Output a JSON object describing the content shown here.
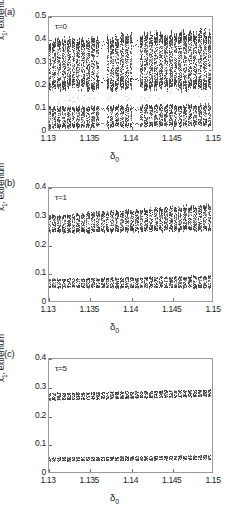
{
  "figure": {
    "type": "bifurcation-diagram",
    "axis_x_label": "δ",
    "axis_x_label_sub": "0",
    "axis_y_label": "x",
    "axis_y_label_sub": "1",
    "axis_y_label_rest": ", extremum"
  },
  "panels": [
    {
      "id": "a",
      "label": "(a)",
      "annotation": "τ=0",
      "ytick_labels": [
        "0.5",
        "0.4",
        "0.3",
        "0.2",
        "0.1",
        "0"
      ],
      "ytick_values": [
        0.5,
        0.4,
        0.3,
        0.2,
        0.1,
        0
      ],
      "xtick_labels": [
        "1.13",
        "1.135",
        "1.14",
        "1.145",
        "1.15"
      ],
      "xtick_values": [
        1.13,
        1.135,
        1.14,
        1.145,
        1.15
      ]
    },
    {
      "id": "b",
      "label": "(b)",
      "annotation": "τ=1",
      "ytick_labels": [
        "0.4",
        "0.3",
        "0.2",
        "0.1",
        "0"
      ],
      "ytick_values": [
        0.4,
        0.3,
        0.2,
        0.1,
        0
      ],
      "xtick_labels": [
        "1.13",
        "1.135",
        "1.14",
        "1.145",
        "1.15"
      ],
      "xtick_values": [
        1.13,
        1.135,
        1.14,
        1.145,
        1.15
      ]
    },
    {
      "id": "c",
      "label": "(c)",
      "annotation": "τ=5",
      "ytick_labels": [
        "0.4",
        "0.3",
        "0.2",
        "0.1",
        "0"
      ],
      "ytick_values": [
        0.4,
        0.3,
        0.2,
        0.1,
        0
      ],
      "xtick_labels": [
        "1.13",
        "1.135",
        "1.14",
        "1.145",
        "1.15"
      ],
      "xtick_values": [
        1.13,
        1.135,
        1.14,
        1.145,
        1.15
      ]
    }
  ],
  "chart_data": [
    {
      "type": "scatter",
      "title": "(a) tau = 0",
      "xlabel": "delta_0",
      "ylabel": "x_1, extremum",
      "xlim": [
        1.13,
        1.15
      ],
      "ylim": [
        0,
        0.5
      ],
      "grid": false,
      "legend": "none",
      "annotation": "τ=0",
      "marker_color": "#3a3a3a",
      "description": "Fully developed chaos: dense point cloud in an upper band roughly 0.18-0.44 and a lower band roughly 0.02-0.12, separated by an empty gap near 0.13-0.17. Narrow periodic windows (vertical white gaps) appear near delta_0 = 1.1365 and 1.1405.",
      "bands": [
        {
          "name": "upper",
          "y_low_at_xmin": 0.19,
          "y_high_at_xmin": 0.4,
          "y_low_at_xmax": 0.19,
          "y_high_at_xmax": 0.44
        },
        {
          "name": "lower",
          "y_low_at_xmin": 0.02,
          "y_high_at_xmin": 0.11,
          "y_low_at_xmax": 0.03,
          "y_high_at_xmax": 0.12
        }
      ],
      "periodic_windows": [
        1.1365,
        1.1405
      ]
    },
    {
      "type": "scatter",
      "title": "(b) tau = 1",
      "xlabel": "delta_0",
      "ylabel": "x_1, extremum",
      "xlim": [
        1.13,
        1.15
      ],
      "ylim": [
        0,
        0.4
      ],
      "grid": false,
      "legend": "none",
      "annotation": "τ=1",
      "marker_color": "#3a3a3a",
      "description": "Two narrow chaotic bands. Upper band spans about 0.245-0.305 at the left edge and widens and drifts up to about 0.255-0.345 near the right edge. Lower band spans about 0.055-0.085 widening slightly to 0.055-0.095.",
      "bands": [
        {
          "name": "upper",
          "y_low_at_xmin": 0.245,
          "y_high_at_xmin": 0.305,
          "y_low_at_xmax": 0.255,
          "y_high_at_xmax": 0.345
        },
        {
          "name": "lower",
          "y_low_at_xmin": 0.055,
          "y_high_at_xmin": 0.085,
          "y_low_at_xmax": 0.055,
          "y_high_at_xmax": 0.095
        }
      ],
      "periodic_windows": []
    },
    {
      "type": "scatter",
      "title": "(c) tau = 5",
      "xlabel": "delta_0",
      "ylabel": "x_1, extremum",
      "xlim": [
        1.13,
        1.15
      ],
      "ylim": [
        0,
        0.4
      ],
      "grid": false,
      "legend": "none",
      "annotation": "τ=5",
      "marker_color": "#3a3a3a",
      "description": "Chaos is strongly suppressed: two thin nearly flat bands. Upper band about 0.258-0.282 at the left, drifting up to about 0.272-0.295 at the right. Lower band about 0.046-0.058 drifting to about 0.052-0.066.",
      "bands": [
        {
          "name": "upper",
          "y_low_at_xmin": 0.258,
          "y_high_at_xmin": 0.282,
          "y_low_at_xmax": 0.272,
          "y_high_at_xmax": 0.295
        },
        {
          "name": "lower",
          "y_low_at_xmin": 0.046,
          "y_high_at_xmin": 0.058,
          "y_low_at_xmax": 0.052,
          "y_high_at_xmax": 0.066
        }
      ],
      "periodic_windows": []
    }
  ]
}
